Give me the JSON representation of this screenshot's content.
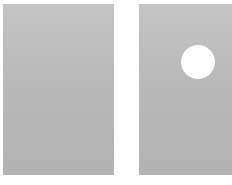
{
  "scene": {
    "background_color": "#ffffff",
    "panels": [
      {
        "id": "left",
        "color": "#bababa",
        "has_circle": false
      },
      {
        "id": "right",
        "color": "#bababa",
        "has_circle": true
      }
    ],
    "circle": {
      "color": "#ffffff",
      "center_x": 198,
      "center_y": 62,
      "radius": 17
    }
  }
}
